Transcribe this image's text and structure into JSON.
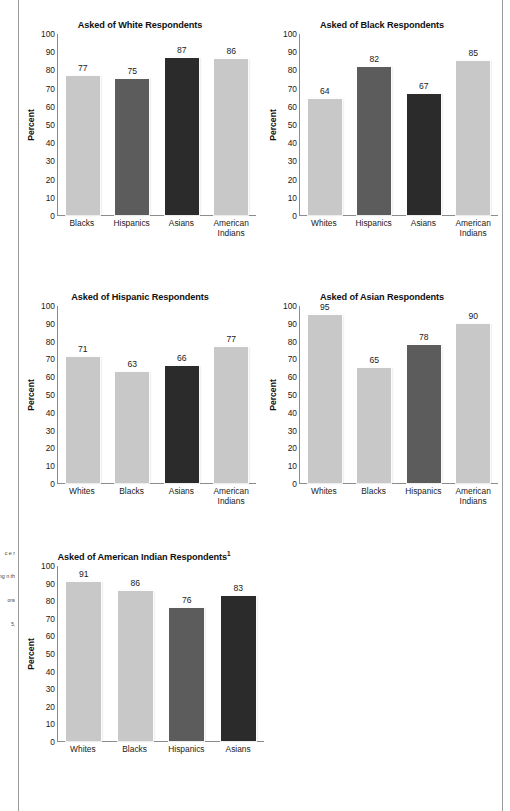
{
  "page": {
    "background": "#ffffff",
    "rule_color": "#9a9a9a"
  },
  "palette": {
    "light": "#c8c8c8",
    "medium": "#5c5c5c",
    "dark": "#2b2b2b",
    "axis": "#8c8c8c",
    "text": "#1a1a1a"
  },
  "margin_notes": {
    "line1": "c",
    "line2": "e",
    "line3": "r",
    "line4": "We",
    "line5": "r.",
    "line6": "sk",
    "line7": "ng",
    "line8": "n",
    "line9": "th",
    "footnote_a": "ons",
    "footnote_b": "5,"
  },
  "axis": {
    "ylabel": "Percent",
    "yticks": [
      0,
      10,
      20,
      30,
      40,
      50,
      60,
      70,
      80,
      90,
      100
    ],
    "ymin": 0,
    "ymax": 100
  },
  "chart_data": [
    {
      "id": "white-respondents",
      "type": "bar",
      "title": "Asked of White Respondents",
      "title_footnote": "",
      "xlabel": "",
      "ylabel": "Percent",
      "ylim": [
        0,
        100
      ],
      "grid": false,
      "legend": "none",
      "categories": [
        "Blacks",
        "Hispanics",
        "Asians",
        "American Indians"
      ],
      "values": [
        77,
        75,
        87,
        86
      ],
      "shades": [
        "light",
        "medium",
        "dark",
        "light"
      ]
    },
    {
      "id": "black-respondents",
      "type": "bar",
      "title": "Asked of Black Respondents",
      "title_footnote": "",
      "xlabel": "",
      "ylabel": "Percent",
      "ylim": [
        0,
        100
      ],
      "grid": false,
      "legend": "none",
      "categories": [
        "Whites",
        "Hispanics",
        "Asians",
        "American Indians"
      ],
      "values": [
        64,
        82,
        67,
        85
      ],
      "shades": [
        "light",
        "medium",
        "dark",
        "light"
      ]
    },
    {
      "id": "hispanic-respondents",
      "type": "bar",
      "title": "Asked of Hispanic Respondents",
      "title_footnote": "",
      "xlabel": "",
      "ylabel": "Percent",
      "ylim": [
        0,
        100
      ],
      "grid": false,
      "legend": "none",
      "categories": [
        "Whites",
        "Blacks",
        "Asians",
        "American Indians"
      ],
      "values": [
        71,
        63,
        66,
        77
      ],
      "shades": [
        "light",
        "light",
        "dark",
        "light"
      ]
    },
    {
      "id": "asian-respondents",
      "type": "bar",
      "title": "Asked of Asian Respondents",
      "title_footnote": "",
      "xlabel": "",
      "ylabel": "Percent",
      "ylim": [
        0,
        100
      ],
      "grid": false,
      "legend": "none",
      "categories": [
        "Whites",
        "Blacks",
        "Hispanics",
        "American Indians"
      ],
      "values": [
        95,
        65,
        78,
        90
      ],
      "shades": [
        "light",
        "light",
        "medium",
        "light"
      ]
    },
    {
      "id": "american-indian-respondents",
      "type": "bar",
      "title": "Asked of American Indian Respondents",
      "title_footnote": "1",
      "xlabel": "",
      "ylabel": "Percent",
      "ylim": [
        0,
        100
      ],
      "grid": false,
      "legend": "none",
      "categories": [
        "Whites",
        "Blacks",
        "Hispanics",
        "Asians"
      ],
      "values": [
        91,
        86,
        76,
        83
      ],
      "shades": [
        "light",
        "light",
        "medium",
        "dark"
      ]
    }
  ]
}
